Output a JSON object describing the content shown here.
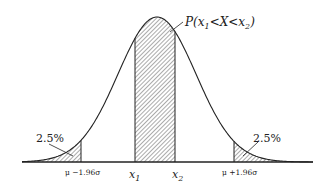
{
  "figure": {
    "curve": {
      "mean_px": 157,
      "sigma_px": 39,
      "peak_y": 17,
      "baseline_y": 162,
      "x_start": 22,
      "x_end": 313
    },
    "regions": [
      {
        "name": "left-tail",
        "from_px": 22,
        "to_px": 81,
        "label": "2.5%"
      },
      {
        "name": "center-interval",
        "from_px": 135,
        "to_px": 175,
        "label": "P(x1<X<x2)"
      },
      {
        "name": "right-tail",
        "from_px": 234,
        "to_px": 313,
        "label": "2.5%"
      }
    ],
    "labels": {
      "probability": "P(x",
      "probability_sub1": "1",
      "probability_mid": "<X<x",
      "probability_sub2": "2",
      "probability_end": ")",
      "left_tail_pct": "2.5%",
      "right_tail_pct": "2.5%",
      "x1": "x",
      "x1_sub": "1",
      "x2": "x",
      "x2_sub": "2",
      "lower_bound": "μ −1.96σ",
      "upper_bound": "μ +1.96σ"
    },
    "colors": {
      "line": "#222222",
      "hatch": "#444444",
      "background": "#ffffff"
    }
  }
}
